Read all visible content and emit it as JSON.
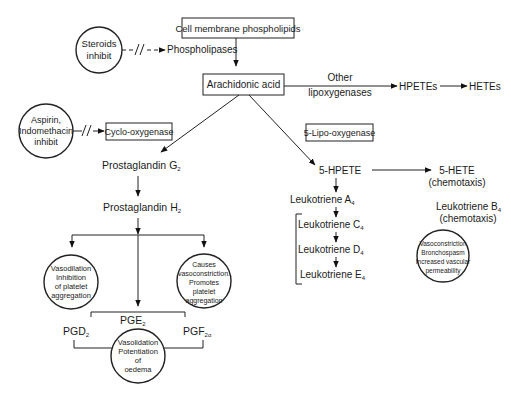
{
  "diagram": {
    "nodes": {
      "cell_membrane": "Cell membrane phospholipids",
      "steroids_l1": "Steroids",
      "steroids_l2": "inhibit",
      "phospholipases": "Phospholipases",
      "arachidonic": "Arachidonic acid",
      "other_l1": "Other",
      "other_l2": "lipoxygenases",
      "hpetes": "HPETEs",
      "hetes": "HETEs",
      "aspirin_l1": "Aspirin,",
      "aspirin_l2": "Indomethacin",
      "aspirin_l3": "inhibit",
      "cyclo": "Cyclo-oxygenase",
      "lipo5": "5-Lipo-oxygenase",
      "pgg": "Prostaglandin G",
      "pgg_sub": "2",
      "pgh": "Prostaglandin H",
      "pgh_sub": "2",
      "hpete5": "5-HPETE",
      "hete5": "5-HETE",
      "hete5_note": "(chemotaxis)",
      "lta": "Leukotriene A",
      "lta_sub": "4",
      "ltb": "Leukotriene B",
      "ltb_sub": "4",
      "ltb_note": "(chemotaxis)",
      "ltc": "Leukotriene C",
      "ltc_sub": "4",
      "ltd": "Leukotriene D",
      "ltd_sub": "4",
      "lte": "Leukotriene E",
      "lte_sub": "4",
      "pgd": "PGD",
      "pgd_sub": "2",
      "pge": "PGE",
      "pge_sub": "2",
      "pgf": "PGF",
      "pgf_sub": "2α"
    },
    "effects": {
      "left": [
        "Vasodilation",
        "Inhibition",
        "of platelet",
        "aggregation"
      ],
      "right": [
        "Causes",
        "vasoconstriction.",
        "Promotes",
        "platelet",
        "aggregation"
      ],
      "bottom": [
        "Vasolidation",
        "Potentiation",
        "of",
        "oedema"
      ],
      "leuko": [
        "Vasoconstriction",
        "Bronchospasm",
        "Increased vascular",
        "permeability"
      ]
    }
  }
}
